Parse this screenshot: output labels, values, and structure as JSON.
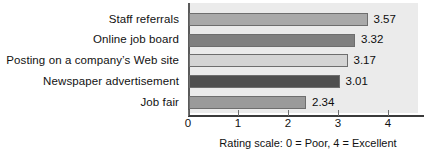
{
  "chart_data": {
    "type": "bar",
    "orientation": "horizontal",
    "title": "",
    "xlabel": "",
    "ylabel": "",
    "categories": [
      "Staff referrals",
      "Online job board",
      "Posting on a company’s Web site",
      "Newspaper advertisement",
      "Job fair"
    ],
    "values": [
      3.57,
      3.32,
      3.17,
      3.01,
      2.34
    ],
    "value_labels": [
      "3.57",
      "3.32",
      "3.17",
      "3.01",
      "2.34"
    ],
    "bar_colors": [
      "#a9a9a9",
      "#808080",
      "#d4d4d4",
      "#4f4f4f",
      "#9a9a9a"
    ],
    "bar_border_color": "#6e6e6e",
    "xlim": [
      0,
      4.6
    ],
    "xticks": [
      0,
      1,
      2,
      3,
      4
    ],
    "xtick_labels": [
      "0",
      "1",
      "2",
      "3",
      "4"
    ],
    "grid": false,
    "legend": "none",
    "plot_background": "#ebebeb",
    "axis_color": "#5a5a5a",
    "caption": "Rating scale: 0 = Poor, 4 = Excellent"
  }
}
